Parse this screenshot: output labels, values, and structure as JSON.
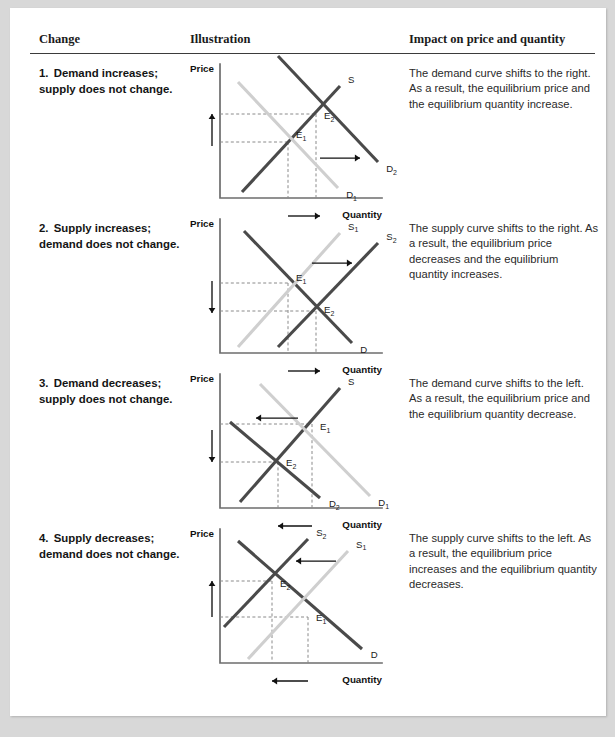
{
  "header": {
    "col_change": "Change",
    "col_illustration": "Illustration",
    "col_impact": "Impact on price and quantity"
  },
  "rows": [
    {
      "number": "1.",
      "change": "Demand increases; supply does not change.",
      "impact": "The demand curve shifts to the right. As a result, the equilibrium price and the equilibrium quantity increase.",
      "chart": {
        "axis_y_label": "Price",
        "axis_x_label": "Quantity",
        "curves": [
          {
            "name": "S",
            "label": "S",
            "sub": "",
            "style": "new",
            "x1": 22,
            "y1": 128,
            "x2": 120,
            "y2": 22
          },
          {
            "name": "D1",
            "label": "D",
            "sub": "1",
            "style": "old",
            "x1": 18,
            "y1": 18,
            "x2": 118,
            "y2": 124
          },
          {
            "name": "D2",
            "label": "D",
            "sub": "2",
            "style": "new",
            "x1": 58,
            "y1": -8,
            "x2": 158,
            "y2": 98
          }
        ],
        "equilibria": [
          {
            "name": "E1",
            "label": "E",
            "sub": "1",
            "x": 68,
            "y": 78,
            "lx": 76,
            "ly": 74
          },
          {
            "name": "E2",
            "label": "E",
            "sub": "2",
            "x": 96,
            "y": 50,
            "lx": 104,
            "ly": 55
          }
        ],
        "price_arrow": {
          "direction": "up",
          "x": 8,
          "y_from": 82,
          "y_to": 50
        },
        "qty_arrow": {
          "direction": "right",
          "y": 152,
          "x_from": 68,
          "x_to": 100
        },
        "shift_arrow": {
          "direction": "right",
          "y": 94,
          "x_from": 100,
          "x_to": 140
        }
      }
    },
    {
      "number": "2.",
      "change": "Supply increases; demand does not change.",
      "impact": "The supply curve shifts to the right. As a result, the equilibrium price decreases and the equilibrium quantity increases.",
      "chart": {
        "axis_y_label": "Price",
        "axis_x_label": "Quantity",
        "curves": [
          {
            "name": "D",
            "label": "D",
            "sub": "",
            "style": "new",
            "x1": 24,
            "y1": 12,
            "x2": 132,
            "y2": 124
          },
          {
            "name": "S1",
            "label": "S",
            "sub": "1",
            "style": "old",
            "x1": 18,
            "y1": 128,
            "x2": 120,
            "y2": 14
          },
          {
            "name": "S2",
            "label": "S",
            "sub": "2",
            "style": "new",
            "x1": 58,
            "y1": 128,
            "x2": 158,
            "y2": 24
          }
        ],
        "equilibria": [
          {
            "name": "E1",
            "label": "E",
            "sub": "1",
            "x": 68,
            "y": 64,
            "lx": 76,
            "ly": 62
          },
          {
            "name": "E2",
            "label": "E",
            "sub": "2",
            "x": 96,
            "y": 92,
            "lx": 104,
            "ly": 94
          }
        ],
        "price_arrow": {
          "direction": "down",
          "x": 8,
          "y_from": 62,
          "y_to": 94
        },
        "qty_arrow": {
          "direction": "right",
          "y": 152,
          "x_from": 68,
          "x_to": 100
        },
        "shift_arrow": {
          "direction": "right",
          "y": 44,
          "x_from": 92,
          "x_to": 132
        }
      }
    },
    {
      "number": "3.",
      "change": "Demand decreases; supply does not change.",
      "impact": "The demand curve shifts to the left. As a result, the equilibrium price and the equilibrium quantity decrease.",
      "chart": {
        "axis_y_label": "Price",
        "axis_x_label": "Quantity",
        "curves": [
          {
            "name": "S",
            "label": "S",
            "sub": "",
            "style": "new",
            "x1": 20,
            "y1": 128,
            "x2": 120,
            "y2": 14
          },
          {
            "name": "D1",
            "label": "D",
            "sub": "1",
            "style": "old",
            "x1": 40,
            "y1": 10,
            "x2": 150,
            "y2": 122
          },
          {
            "name": "D2",
            "label": "D",
            "sub": "2",
            "style": "new",
            "x1": 10,
            "y1": 48,
            "x2": 100,
            "y2": 124
          }
        ],
        "equilibria": [
          {
            "name": "E1",
            "label": "E",
            "sub": "1",
            "x": 92,
            "y": 50,
            "lx": 100,
            "ly": 56
          },
          {
            "name": "E2",
            "label": "E",
            "sub": "2",
            "x": 58,
            "y": 88,
            "lx": 66,
            "ly": 92
          }
        ],
        "price_arrow": {
          "direction": "down",
          "x": 8,
          "y_from": 56,
          "y_to": 88
        },
        "qty_arrow": {
          "direction": "left",
          "y": 152,
          "x_from": 92,
          "x_to": 58
        },
        "shift_arrow": {
          "direction": "left",
          "y": 44,
          "x_from": 78,
          "x_to": 36
        }
      }
    },
    {
      "number": "4.",
      "change": "Supply decreases; demand does not change.",
      "impact": "The supply curve shifts to the left. As a result, the equilibrium price increases and the equilibrium quantity decreases.",
      "chart": {
        "axis_y_label": "Price",
        "axis_x_label": "Quantity",
        "curves": [
          {
            "name": "D",
            "label": "D",
            "sub": "",
            "style": "new",
            "x1": 18,
            "y1": 12,
            "x2": 142,
            "y2": 120
          },
          {
            "name": "S1",
            "label": "S",
            "sub": "1",
            "style": "old",
            "x1": 28,
            "y1": 130,
            "x2": 128,
            "y2": 22
          },
          {
            "name": "S2",
            "label": "S",
            "sub": "2",
            "style": "new",
            "x1": 4,
            "y1": 98,
            "x2": 88,
            "y2": 10
          }
        ],
        "equilibria": [
          {
            "name": "E1",
            "label": "E",
            "sub": "1",
            "x": 88,
            "y": 88,
            "lx": 96,
            "ly": 92
          },
          {
            "name": "E2",
            "label": "E",
            "sub": "2",
            "x": 52,
            "y": 52,
            "lx": 60,
            "ly": 58
          }
        ],
        "price_arrow": {
          "direction": "up",
          "x": 8,
          "y_from": 88,
          "y_to": 52
        },
        "qty_arrow": {
          "direction": "left",
          "y": 152,
          "x_from": 88,
          "x_to": 52
        },
        "shift_arrow": {
          "direction": "left",
          "y": 32,
          "x_from": 116,
          "x_to": 76
        }
      }
    }
  ],
  "chart_data": {
    "type": "line",
    "xlabel": "Quantity",
    "ylabel": "Price",
    "grid": false,
    "legend": "inline curve labels",
    "panels": [
      {
        "panel": 1,
        "change": "Demand increases; supply does not change",
        "shifting_curve": "Demand",
        "shift_direction": "right",
        "price_effect": "increase",
        "quantity_effect": "increase",
        "curves": [
          "S",
          "D1",
          "D2"
        ],
        "equilibria": [
          {
            "name": "E1",
            "relative_price": 0.4,
            "relative_quantity": 0.4
          },
          {
            "name": "E2",
            "relative_price": 0.62,
            "relative_quantity": 0.6
          }
        ]
      },
      {
        "panel": 2,
        "change": "Supply increases; demand does not change",
        "shifting_curve": "Supply",
        "shift_direction": "right",
        "price_effect": "decrease",
        "quantity_effect": "increase",
        "curves": [
          "D",
          "S1",
          "S2"
        ],
        "equilibria": [
          {
            "name": "E1",
            "relative_price": 0.52,
            "relative_quantity": 0.42
          },
          {
            "name": "E2",
            "relative_price": 0.3,
            "relative_quantity": 0.62
          }
        ]
      },
      {
        "panel": 3,
        "change": "Demand decreases; supply does not change",
        "shifting_curve": "Demand",
        "shift_direction": "left",
        "price_effect": "decrease",
        "quantity_effect": "decrease",
        "curves": [
          "S",
          "D1",
          "D2"
        ],
        "equilibria": [
          {
            "name": "E1",
            "relative_price": 0.62,
            "relative_quantity": 0.58
          },
          {
            "name": "E2",
            "relative_price": 0.33,
            "relative_quantity": 0.36
          }
        ]
      },
      {
        "panel": 4,
        "change": "Supply decreases; demand does not change",
        "shifting_curve": "Supply",
        "shift_direction": "left",
        "price_effect": "increase",
        "quantity_effect": "decrease",
        "curves": [
          "D",
          "S1",
          "S2"
        ],
        "equilibria": [
          {
            "name": "E1",
            "relative_price": 0.33,
            "relative_quantity": 0.56
          },
          {
            "name": "E2",
            "relative_price": 0.6,
            "relative_quantity": 0.33
          }
        ]
      }
    ]
  }
}
